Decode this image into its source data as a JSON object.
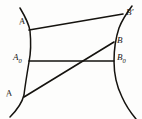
{
  "figure": {
    "background_color": "#fdfdfc",
    "stroke_color": "#15130f",
    "width": 142,
    "height": 119,
    "labels": {
      "a_prime": "A",
      "a_prime_mark": "′",
      "a_zero": "A",
      "a_zero_sub": "0",
      "a": "A",
      "b_prime": "B",
      "b_prime_mark": "′",
      "b": "B",
      "b_zero": "B",
      "b_zero_sub": "0"
    },
    "points": [
      {
        "name": "A-prime",
        "label": "A′",
        "x": 30,
        "y": 29
      },
      {
        "name": "A-zero",
        "label": "A₀",
        "x": 28,
        "y": 61
      },
      {
        "name": "A",
        "label": "A",
        "x": 25,
        "y": 97
      },
      {
        "name": "B-prime",
        "label": "B′",
        "x": 122,
        "y": 15
      },
      {
        "name": "B",
        "label": "B",
        "x": 113,
        "y": 43
      },
      {
        "name": "B-zero",
        "label": "B₀",
        "x": 114,
        "y": 61
      }
    ],
    "chords": [
      {
        "name": "chord-a-prime-b-prime",
        "from": "A′",
        "to": "B′"
      },
      {
        "name": "chord-a-zero-b-zero",
        "from": "A₀",
        "to": "B₀"
      },
      {
        "name": "chord-a-b",
        "from": "A",
        "to": "B"
      }
    ],
    "curves": [
      {
        "name": "left-arc",
        "bows": "right"
      },
      {
        "name": "right-arc",
        "bows": "left"
      }
    ]
  }
}
